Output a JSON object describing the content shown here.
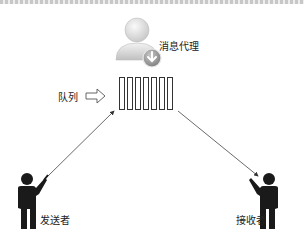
{
  "diagram": {
    "type": "message-queue-architecture",
    "nodes": {
      "broker": {
        "label": "消息代理",
        "icon": "user-download-icon"
      },
      "queue": {
        "label": "队列",
        "icon": "queue-slots-icon",
        "slot_count": 7
      },
      "sender": {
        "label": "发送者",
        "icon": "presenter-person-icon"
      },
      "receiver": {
        "label": "接收者",
        "icon": "presenter-person-icon"
      }
    },
    "edges": [
      {
        "from": "sender",
        "to": "queue",
        "style": "arrow"
      },
      {
        "from": "queue",
        "to": "receiver",
        "style": "arrow"
      }
    ],
    "pointer": {
      "from": "queue_label",
      "to": "queue",
      "icon": "hollow-arrow-right-icon"
    }
  },
  "colors": {
    "stroke": "#333333",
    "figure": "#1a1a1a",
    "broker_icon": "#d4d4d4",
    "badge": "#9a9a9a"
  }
}
